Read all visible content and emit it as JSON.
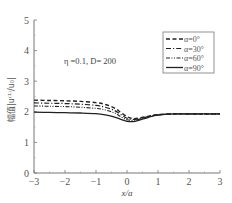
{
  "chart_data": {
    "type": "line",
    "title": "",
    "annotation": "η =0.1, D= 200",
    "xlabel": "x/a",
    "ylabel": "幅值|u⁽¹⁾/u₀|",
    "xlim": [
      -3,
      3
    ],
    "ylim": [
      0,
      5
    ],
    "xticks": [
      -3,
      -2,
      -1,
      0,
      1,
      2,
      3
    ],
    "yticks": [
      0,
      1,
      2,
      3,
      4,
      5
    ],
    "xtick_labels": [
      "−3",
      "−2",
      "−1",
      "0",
      "1",
      "2",
      "3"
    ],
    "ytick_labels": [
      "0",
      "1",
      "2",
      "3",
      "4",
      "5"
    ],
    "grid": false,
    "legend_position": "top-right",
    "x": [
      -3,
      -2.5,
      -2,
      -1.5,
      -1,
      -0.7,
      -0.4,
      -0.2,
      0,
      0.2,
      0.4,
      0.7,
      1,
      1.5,
      2,
      2.5,
      3
    ],
    "series": [
      {
        "name": "α=0°",
        "style": "dashed",
        "values": [
          2.38,
          2.37,
          2.36,
          2.34,
          2.3,
          2.24,
          2.12,
          1.98,
          1.84,
          1.78,
          1.8,
          1.86,
          1.91,
          1.93,
          1.93,
          1.93,
          1.93
        ]
      },
      {
        "name": "α=30°",
        "style": "dashdot",
        "values": [
          2.29,
          2.28,
          2.27,
          2.25,
          2.21,
          2.15,
          2.04,
          1.91,
          1.79,
          1.75,
          1.78,
          1.85,
          1.9,
          1.93,
          1.93,
          1.93,
          1.93
        ]
      },
      {
        "name": "α=60°",
        "style": "dashdotdot",
        "values": [
          2.19,
          2.18,
          2.17,
          2.15,
          2.11,
          2.06,
          1.96,
          1.84,
          1.74,
          1.72,
          1.76,
          1.84,
          1.9,
          1.93,
          1.93,
          1.93,
          1.93
        ]
      },
      {
        "name": "α=90°",
        "style": "solid",
        "values": [
          1.99,
          1.98,
          1.97,
          1.96,
          1.94,
          1.9,
          1.83,
          1.75,
          1.69,
          1.68,
          1.73,
          1.82,
          1.89,
          1.93,
          1.93,
          1.93,
          1.93
        ]
      }
    ]
  }
}
